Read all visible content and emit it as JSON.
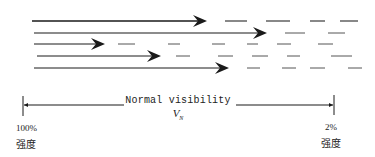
{
  "diagram": {
    "colors": {
      "line": "#1a1a1a",
      "dash": "#555555",
      "text": "#222222"
    },
    "rays": [
      {
        "y": 21,
        "x_start": 32,
        "x_tip": 207,
        "width": 1.6,
        "dashes": [
          [
            225,
            247
          ],
          [
            266,
            290
          ],
          [
            310,
            325
          ],
          [
            340,
            358
          ]
        ]
      },
      {
        "y": 33,
        "x_start": 34,
        "x_tip": 267,
        "width": 1.1,
        "dashes": [
          [
            285,
            305
          ],
          [
            328,
            345
          ]
        ]
      },
      {
        "y": 44,
        "x_start": 34,
        "x_tip": 105,
        "width": 1.0,
        "dashes": [
          [
            118,
            135
          ],
          [
            168,
            180
          ],
          [
            212,
            225
          ],
          [
            247,
            258
          ],
          [
            277,
            291
          ],
          [
            318,
            333
          ]
        ]
      },
      {
        "y": 56,
        "x_start": 37,
        "x_tip": 161,
        "width": 1.0,
        "dashes": [
          [
            176,
            190
          ],
          [
            218,
            233
          ],
          [
            252,
            268
          ],
          [
            287,
            300
          ],
          [
            331,
            352
          ]
        ]
      },
      {
        "y": 68,
        "x_start": 34,
        "x_tip": 229,
        "width": 1.0,
        "dashes": [
          [
            247,
            260
          ],
          [
            282,
            296
          ],
          [
            310,
            325
          ],
          [
            348,
            362
          ]
        ]
      }
    ],
    "scale": {
      "y": 105,
      "left_tick_x": 23,
      "right_tick_x": 334,
      "left_line_end": 124,
      "right_line_start": 236,
      "label": "Normal visibility",
      "symbol": "V",
      "symbol_sub": "N",
      "left_percent": "100%",
      "left_caption": "强度",
      "right_percent": "2%",
      "right_caption": "强度"
    }
  }
}
